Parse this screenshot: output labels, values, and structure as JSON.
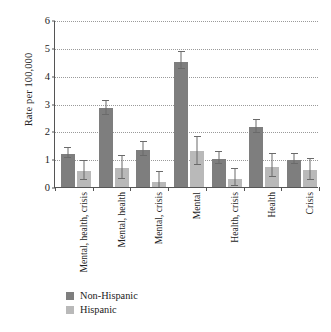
{
  "chart_data": {
    "type": "bar",
    "title": "",
    "xlabel": "",
    "ylabel": "Rate per 100,000",
    "ylim": [
      0,
      6
    ],
    "yticks": [
      0,
      1,
      2,
      3,
      4,
      5,
      6
    ],
    "ytick_labels": [
      "0",
      "1",
      "2",
      "3",
      "4",
      "5",
      "6"
    ],
    "grid": "horizontal-dotted",
    "legend_position": "bottom-left",
    "orientation": "vertical-grouped",
    "error_bars": true,
    "categories": [
      "Mental, health, crisis",
      "Mental, health",
      "Mental, crisis",
      "Mental",
      "Health, crisis",
      "Health",
      "Crisis"
    ],
    "series": [
      {
        "name": "Non-Hispanic",
        "color": "#7e7e7e",
        "values": [
          1.2,
          2.85,
          1.32,
          4.5,
          1.02,
          2.17,
          0.98
        ],
        "err_low": [
          1.05,
          2.6,
          1.1,
          4.25,
          0.82,
          1.95,
          0.82
        ],
        "err_high": [
          1.4,
          3.1,
          1.6,
          4.85,
          1.25,
          2.4,
          1.18
        ]
      },
      {
        "name": "Hispanic",
        "color": "#b9b9b9",
        "values": [
          0.57,
          0.68,
          0.18,
          1.3,
          0.3,
          0.73,
          0.62
        ],
        "err_low": [
          0.25,
          0.28,
          0.0,
          0.8,
          0.05,
          0.35,
          0.25
        ],
        "err_high": [
          0.95,
          1.1,
          0.55,
          1.8,
          0.65,
          1.2,
          1.0
        ]
      }
    ]
  },
  "legend": {
    "items": [
      {
        "label": "Non-Hispanic",
        "color": "#7e7e7e"
      },
      {
        "label": "Hispanic",
        "color": "#b9b9b9"
      }
    ]
  }
}
